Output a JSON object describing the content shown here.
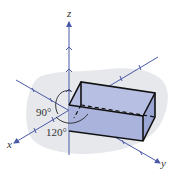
{
  "diagram": {
    "type": "3d-coordinate-axes-with-box",
    "axes": {
      "x": {
        "label": "x"
      },
      "y": {
        "label": "y"
      },
      "z": {
        "label": "z"
      }
    },
    "angles": [
      {
        "label": "90°"
      },
      {
        "label": "120°"
      }
    ],
    "colors": {
      "axis": "#4a5aa8",
      "box_fill": "#a9b3dc",
      "box_edge": "#111111",
      "background_blob": "#e6e8ec"
    }
  }
}
